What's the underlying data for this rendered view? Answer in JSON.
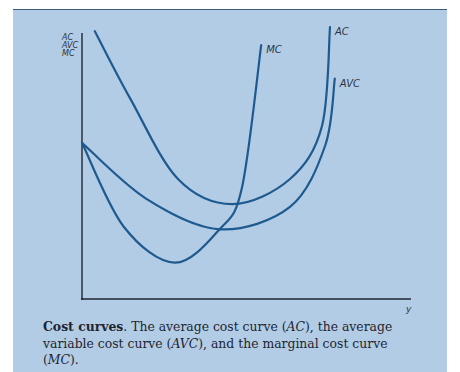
{
  "chart_data": {
    "type": "line",
    "title": "",
    "xlabel": "y",
    "ylabel": [
      "AC",
      "AVC",
      "MC"
    ],
    "xlim": [
      0,
      10
    ],
    "ylim": [
      0,
      10
    ],
    "grid": false,
    "legend": "curve-end labels",
    "series": [
      {
        "name": "AC",
        "label": "AC",
        "points": [
          [
            0.4,
            9.6
          ],
          [
            1.5,
            7.2
          ],
          [
            3.0,
            4.3
          ],
          [
            4.7,
            3.4
          ],
          [
            6.5,
            4.3
          ],
          [
            7.5,
            6.2
          ],
          [
            7.75,
            9.75
          ]
        ]
      },
      {
        "name": "AVC",
        "label": "AVC",
        "points": [
          [
            0,
            5.6
          ],
          [
            2.0,
            3.6
          ],
          [
            4.3,
            2.5
          ],
          [
            6.5,
            3.3
          ],
          [
            7.6,
            5.5
          ],
          [
            7.9,
            7.9
          ]
        ]
      },
      {
        "name": "MC",
        "label": "MC",
        "points": [
          [
            0,
            5.6
          ],
          [
            1.3,
            2.6
          ],
          [
            2.9,
            1.3
          ],
          [
            4.3,
            2.5
          ],
          [
            5.0,
            4.0
          ],
          [
            5.6,
            9.1
          ]
        ]
      }
    ],
    "line_color": "#1f5a8f"
  },
  "figure": {
    "background": "#b3cce6",
    "axis_color": "#1e2630"
  },
  "caption": {
    "bold": "Cost curves",
    "text_1": ". The average cost curve (",
    "ac": "AC",
    "text_2": "), the average variable cost curve (",
    "avc": "AVC",
    "text_3": "), and the marginal cost curve (",
    "mc": "MC",
    "text_4": ")."
  }
}
